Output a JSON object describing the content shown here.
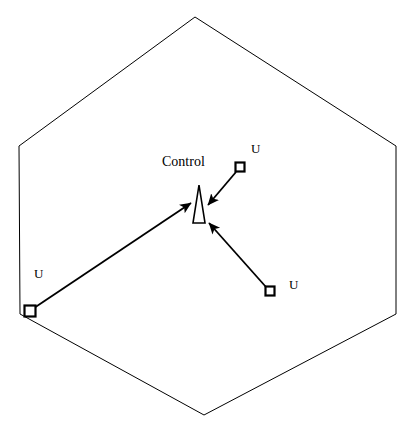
{
  "diagram": {
    "background_color": "#ffffff",
    "stroke_color": "#000000",
    "canvas": {
      "width": 414,
      "height": 430
    },
    "boundary": {
      "name": "hexagon-boundary",
      "shape": "hexagon",
      "stroke_width": 1,
      "fill": "none",
      "points": "195,17 396,146 396,314 204,415 20,314 19,146"
    },
    "control": {
      "label": "Control",
      "label_x": 162,
      "label_y": 155,
      "marker_shape": "narrow-triangle",
      "marker_points": "199,185 205,223 193,223",
      "fill": "#ffffff",
      "stroke_width": 1.6
    },
    "nodes": [
      {
        "id": "node-top-right",
        "label": "U",
        "label_x": 251,
        "label_y": 142,
        "x": 240,
        "y": 167,
        "size": 9,
        "shape": "square"
      },
      {
        "id": "node-bottom-right",
        "label": "U",
        "label_x": 289,
        "label_y": 278,
        "x": 270,
        "y": 291,
        "size": 9,
        "shape": "square"
      },
      {
        "id": "node-left",
        "label": "U",
        "label_x": 34,
        "label_y": 267,
        "x": 30,
        "y": 311,
        "size": 11,
        "shape": "square"
      }
    ],
    "arrows": [
      {
        "id": "arrow-top-right-to-control",
        "from": "node-top-right",
        "to": "control",
        "x1": 236,
        "y1": 172,
        "x2": 208,
        "y2": 205,
        "stroke_width": 1.8
      },
      {
        "id": "arrow-bottom-right-to-control",
        "from": "node-bottom-right",
        "to": "control",
        "x1": 266,
        "y1": 287,
        "x2": 209,
        "y2": 223,
        "stroke_width": 1.8
      },
      {
        "id": "arrow-left-to-control",
        "from": "node-left",
        "to": "control",
        "x1": 34,
        "y1": 308,
        "x2": 191,
        "y2": 203,
        "stroke_width": 1.8
      }
    ]
  }
}
